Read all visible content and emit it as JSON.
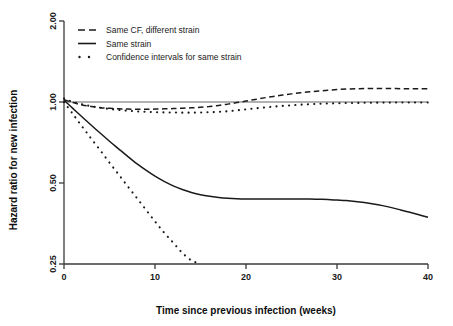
{
  "chart_data": {
    "type": "line",
    "title": "",
    "xlabel": "Time since previous infection (weeks)",
    "ylabel": "Hazard ratio for new infection",
    "xlim": [
      0,
      40
    ],
    "ylim": [
      0.25,
      2.0
    ],
    "yscale": "log",
    "grid": false,
    "reference_line": {
      "y": 1.0,
      "color": "#999999"
    },
    "xticks": [
      0,
      10,
      20,
      30,
      40
    ],
    "xtick_labels": [
      "0",
      "10",
      "20",
      "30",
      "40"
    ],
    "yticks": [
      0.25,
      0.5,
      1.0,
      2.0
    ],
    "ytick_labels": [
      "0.25",
      "0.50",
      "1.00",
      "2.00"
    ],
    "legend_position": "top-left",
    "series": [
      {
        "name": "Same CF, different strain",
        "style": "dashed",
        "color": "#1a1a1a",
        "x": [
          0,
          1,
          2,
          3,
          4,
          5,
          6,
          7,
          8,
          9,
          10,
          11,
          12,
          13,
          14,
          15,
          16,
          17,
          18,
          19,
          20,
          21,
          22,
          23,
          24,
          25,
          26,
          27,
          28,
          29,
          30,
          31,
          32,
          33,
          34,
          35,
          36,
          37,
          38,
          39,
          40
        ],
        "values": [
          1.02,
          0.995,
          0.975,
          0.962,
          0.953,
          0.947,
          0.943,
          0.941,
          0.94,
          0.94,
          0.941,
          0.943,
          0.945,
          0.948,
          0.951,
          0.956,
          0.962,
          0.971,
          0.982,
          0.995,
          1.008,
          1.022,
          1.036,
          1.049,
          1.061,
          1.072,
          1.082,
          1.091,
          1.099,
          1.106,
          1.112,
          1.117,
          1.12,
          1.122,
          1.123,
          1.123,
          1.122,
          1.121,
          1.12,
          1.12,
          1.12
        ]
      },
      {
        "name": "Same strain",
        "style": "solid",
        "color": "#1a1a1a",
        "x": [
          0,
          1,
          2,
          3,
          4,
          5,
          6,
          7,
          8,
          9,
          10,
          11,
          12,
          13,
          14,
          15,
          16,
          17,
          18,
          19,
          20,
          21,
          22,
          23,
          24,
          25,
          26,
          27,
          28,
          29,
          30,
          31,
          32,
          33,
          34,
          35,
          36,
          37,
          38,
          39,
          40
        ],
        "values": [
          1.015,
          0.945,
          0.88,
          0.82,
          0.765,
          0.715,
          0.67,
          0.628,
          0.59,
          0.558,
          0.53,
          0.507,
          0.488,
          0.473,
          0.461,
          0.452,
          0.446,
          0.442,
          0.439,
          0.437,
          0.436,
          0.436,
          0.436,
          0.436,
          0.436,
          0.436,
          0.436,
          0.436,
          0.435,
          0.434,
          0.432,
          0.43,
          0.427,
          0.423,
          0.418,
          0.412,
          0.405,
          0.397,
          0.389,
          0.381,
          0.373
        ]
      },
      {
        "name": "Confidence intervals for same strain",
        "style": "dotted",
        "color": "#1a1a1a",
        "bound": "upper",
        "x": [
          0,
          1,
          2,
          3,
          4,
          5,
          6,
          7,
          8,
          9,
          10,
          11,
          12,
          13,
          14,
          15,
          16,
          17,
          18,
          19,
          20,
          21,
          22,
          23,
          24,
          25,
          26,
          27,
          28,
          29,
          30,
          31,
          32,
          33,
          34,
          35,
          36,
          37,
          38,
          39,
          40
        ],
        "values": [
          1.03,
          1.0,
          0.98,
          0.965,
          0.952,
          0.942,
          0.934,
          0.928,
          0.923,
          0.92,
          0.917,
          0.915,
          0.914,
          0.913,
          0.913,
          0.914,
          0.916,
          0.919,
          0.924,
          0.931,
          0.939,
          0.947,
          0.954,
          0.961,
          0.967,
          0.972,
          0.977,
          0.981,
          0.984,
          0.987,
          0.989,
          0.991,
          0.992,
          0.993,
          0.994,
          0.995,
          0.995,
          0.996,
          0.996,
          0.996,
          0.996
        ]
      },
      {
        "name": "Confidence intervals for same strain",
        "style": "dotted",
        "color": "#1a1a1a",
        "bound": "lower",
        "x": [
          0,
          1,
          2,
          3,
          4,
          5,
          6,
          7,
          8,
          9,
          10,
          11,
          12,
          13,
          14,
          15
        ],
        "values": [
          1.0,
          0.9,
          0.81,
          0.73,
          0.66,
          0.595,
          0.538,
          0.486,
          0.44,
          0.398,
          0.36,
          0.327,
          0.3,
          0.275,
          0.258,
          0.25
        ]
      }
    ]
  },
  "legend": {
    "items": [
      {
        "label": "Same CF, different strain",
        "style": "dashed"
      },
      {
        "label": "Same strain",
        "style": "solid"
      },
      {
        "label": "Confidence intervals for same strain",
        "style": "dotted"
      }
    ]
  },
  "axes": {
    "x_title": "Time since previous infection (weeks)",
    "y_title": "Hazard ratio for new infection"
  }
}
